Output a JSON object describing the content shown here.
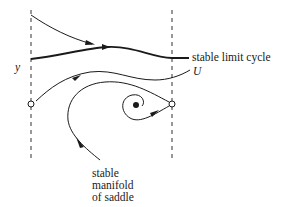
{
  "diagram": {
    "labels": {
      "limit_cycle": "stable limit cycle",
      "u": "U",
      "y": "y",
      "manifold_line1": "stable",
      "manifold_line2": "manifold",
      "manifold_line3": "of saddle"
    },
    "elements": {
      "left_boundary": "dashed vertical line",
      "right_boundary": "dashed vertical line",
      "left_saddle": "open circle (saddle point)",
      "right_saddle": "open circle (saddle point)",
      "focus": "filled dot (unstable focus)",
      "limit_cycle": "thick curve",
      "top_trajectory": "curve with arrow approaching limit cycle",
      "u_curve": "curve with arrow",
      "stable_manifold": "curve with arrow into right saddle"
    },
    "colors": {
      "stroke": "#1a1a1a",
      "background": "#ffffff"
    }
  }
}
